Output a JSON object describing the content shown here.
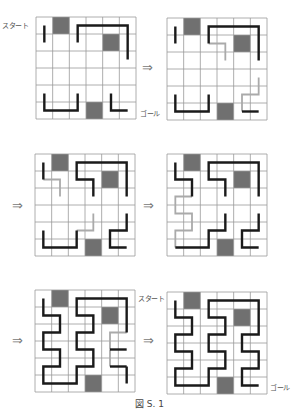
{
  "figure": {
    "caption": "図 S. 1",
    "start_label": "スタート",
    "goal_label": "ゴール",
    "arrow_glyph": "⇒",
    "grid_size": 6,
    "blocked_cells": [
      [
        1,
        0
      ],
      [
        4,
        1
      ],
      [
        3,
        5
      ]
    ],
    "colors": {
      "grid_line": "#999999",
      "blocked": "#707070",
      "path_main": "#1a1a1a",
      "path_trial": "#aaaaaa"
    }
  },
  "panels": [
    {
      "id": 1,
      "main": [
        [
          [
            0,
            0
          ],
          [
            0,
            1
          ]
        ],
        [
          [
            2,
            1
          ],
          [
            2,
            0
          ],
          [
            5,
            0
          ],
          [
            5,
            2
          ]
        ],
        [
          [
            0,
            4
          ],
          [
            0,
            5
          ],
          [
            2,
            5
          ],
          [
            2,
            4
          ]
        ],
        [
          [
            4,
            4
          ],
          [
            4,
            5
          ],
          [
            5,
            5
          ]
        ]
      ],
      "trial": []
    },
    {
      "id": 2,
      "main": [
        [
          [
            0,
            0
          ],
          [
            0,
            1
          ]
        ],
        [
          [
            2,
            1
          ],
          [
            2,
            0
          ],
          [
            5,
            0
          ],
          [
            5,
            2
          ]
        ],
        [
          [
            0,
            4
          ],
          [
            0,
            5
          ],
          [
            2,
            5
          ],
          [
            2,
            4
          ]
        ],
        [
          [
            4,
            5
          ],
          [
            5,
            5
          ]
        ]
      ],
      "trial": [
        [
          [
            2,
            1
          ],
          [
            3,
            1
          ],
          [
            3,
            2
          ]
        ],
        [
          [
            5,
            3
          ],
          [
            5,
            4
          ],
          [
            4,
            4
          ],
          [
            4,
            5
          ]
        ]
      ]
    },
    {
      "id": 3,
      "main": [
        [
          [
            0,
            0
          ],
          [
            0,
            1
          ]
        ],
        [
          [
            3,
            2
          ],
          [
            3,
            1
          ],
          [
            2,
            1
          ],
          [
            2,
            0
          ],
          [
            5,
            0
          ],
          [
            5,
            2
          ]
        ],
        [
          [
            0,
            4
          ],
          [
            0,
            5
          ],
          [
            2,
            5
          ],
          [
            2,
            4
          ]
        ],
        [
          [
            5,
            3
          ],
          [
            5,
            4
          ],
          [
            4,
            4
          ],
          [
            4,
            5
          ],
          [
            5,
            5
          ]
        ]
      ],
      "trial": [
        [
          [
            0,
            1
          ],
          [
            1,
            1
          ],
          [
            1,
            2
          ]
        ],
        [
          [
            2,
            4
          ],
          [
            3,
            4
          ],
          [
            3,
            3
          ]
        ]
      ]
    },
    {
      "id": 4,
      "main": [
        [
          [
            0,
            0
          ],
          [
            0,
            1
          ],
          [
            1,
            1
          ],
          [
            1,
            2
          ]
        ],
        [
          [
            3,
            2
          ],
          [
            3,
            1
          ],
          [
            2,
            1
          ],
          [
            2,
            0
          ],
          [
            5,
            0
          ],
          [
            5,
            2
          ]
        ],
        [
          [
            0,
            5
          ],
          [
            2,
            5
          ],
          [
            2,
            4
          ],
          [
            3,
            4
          ],
          [
            3,
            3
          ]
        ],
        [
          [
            5,
            3
          ],
          [
            5,
            4
          ],
          [
            4,
            4
          ],
          [
            4,
            5
          ],
          [
            5,
            5
          ]
        ]
      ],
      "trial": [
        [
          [
            1,
            2
          ],
          [
            0,
            2
          ],
          [
            0,
            3
          ],
          [
            1,
            3
          ],
          [
            1,
            4
          ],
          [
            0,
            4
          ],
          [
            0,
            5
          ]
        ]
      ]
    },
    {
      "id": 5,
      "main": [
        [
          [
            0,
            0
          ],
          [
            0,
            1
          ],
          [
            1,
            1
          ],
          [
            1,
            2
          ],
          [
            0,
            2
          ],
          [
            0,
            3
          ],
          [
            1,
            3
          ],
          [
            1,
            4
          ],
          [
            0,
            4
          ],
          [
            0,
            5
          ],
          [
            2,
            5
          ],
          [
            2,
            4
          ],
          [
            3,
            4
          ],
          [
            3,
            3
          ],
          [
            2,
            3
          ],
          [
            2,
            2
          ],
          [
            3,
            2
          ],
          [
            3,
            1
          ],
          [
            2,
            1
          ],
          [
            2,
            0
          ],
          [
            5,
            0
          ],
          [
            5,
            2
          ]
        ],
        [
          [
            5,
            3
          ],
          [
            4,
            3
          ]
        ],
        [
          [
            4,
            4
          ],
          [
            5,
            4
          ]
        ],
        [
          [
            5,
            4
          ],
          [
            5,
            5
          ]
        ]
      ],
      "trial": [
        [
          [
            5,
            2
          ],
          [
            4,
            2
          ],
          [
            4,
            3
          ]
        ],
        [
          [
            4,
            3
          ],
          [
            4,
            4
          ]
        ]
      ],
      "start_label_side": "right"
    },
    {
      "id": 6,
      "main": [
        [
          [
            0,
            0
          ],
          [
            0,
            1
          ],
          [
            1,
            1
          ],
          [
            1,
            2
          ],
          [
            0,
            2
          ],
          [
            0,
            3
          ],
          [
            1,
            3
          ],
          [
            1,
            4
          ],
          [
            0,
            4
          ],
          [
            0,
            5
          ],
          [
            2,
            5
          ],
          [
            2,
            4
          ],
          [
            3,
            4
          ],
          [
            3,
            3
          ],
          [
            2,
            3
          ],
          [
            2,
            2
          ],
          [
            3,
            2
          ],
          [
            3,
            1
          ],
          [
            2,
            1
          ],
          [
            2,
            0
          ],
          [
            5,
            0
          ],
          [
            5,
            2
          ],
          [
            4,
            2
          ],
          [
            4,
            3
          ],
          [
            5,
            3
          ],
          [
            5,
            4
          ],
          [
            4,
            4
          ],
          [
            4,
            5
          ],
          [
            5,
            5
          ]
        ]
      ],
      "trial": []
    }
  ]
}
